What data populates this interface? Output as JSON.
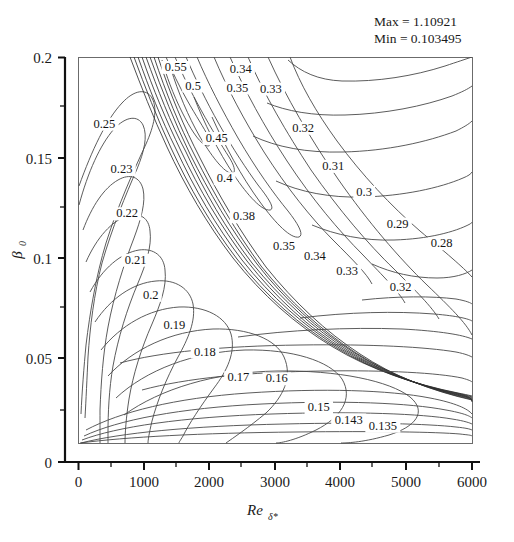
{
  "figure": {
    "kind": "contour-plot",
    "background": "#ffffff",
    "line_color": "#4a4a4a",
    "text_color": "#1a1a1a"
  },
  "annotations": {
    "max_line": "Max = 1.10921",
    "min_line": "Min = 0.103495"
  },
  "axes": {
    "x_title_main": "Re",
    "x_title_sub": "δ*",
    "y_title_main": "β",
    "y_title_sub": "0",
    "x_ticks": [
      "0",
      "1000",
      "2000",
      "3000",
      "4000",
      "5000",
      "6000"
    ],
    "y_ticks": [
      "0",
      "0.05",
      "0.1",
      "0.15",
      "0.2"
    ]
  },
  "chart_data": {
    "type": "contour",
    "title": "",
    "xlabel": "Re_delta*",
    "ylabel": "beta_0",
    "xlim": [
      0,
      6000
    ],
    "ylim": [
      0,
      0.2
    ],
    "plot_box": {
      "x0": 0,
      "x1": 6000,
      "y0": 0.0128,
      "y1": 0.2
    },
    "grid": false,
    "legend": null,
    "max_value": 1.10921,
    "min_value": 0.103495,
    "levels": [
      0.135,
      0.143,
      0.15,
      0.16,
      0.17,
      0.18,
      0.19,
      0.2,
      0.21,
      0.22,
      0.23,
      0.25,
      0.28,
      0.29,
      0.3,
      0.31,
      0.32,
      0.33,
      0.34,
      0.35,
      0.38,
      0.4,
      0.45,
      0.5,
      0.55
    ],
    "labels": [
      {
        "text": "0.55",
        "x": 1480,
        "y": 0.1935
      },
      {
        "text": "0.5",
        "x": 1745,
        "y": 0.1845
      },
      {
        "text": "0.34",
        "x": 2470,
        "y": 0.1925
      },
      {
        "text": "0.35",
        "x": 2420,
        "y": 0.1835
      },
      {
        "text": "0.33",
        "x": 2930,
        "y": 0.183
      },
      {
        "text": "0.25",
        "x": 395,
        "y": 0.166
      },
      {
        "text": "0.45",
        "x": 2105,
        "y": 0.159
      },
      {
        "text": "0.32",
        "x": 3420,
        "y": 0.164
      },
      {
        "text": "0.31",
        "x": 3880,
        "y": 0.1455
      },
      {
        "text": "0.23",
        "x": 655,
        "y": 0.144
      },
      {
        "text": "0.4",
        "x": 2225,
        "y": 0.1395
      },
      {
        "text": "0.3",
        "x": 4350,
        "y": 0.133
      },
      {
        "text": "0.38",
        "x": 2520,
        "y": 0.121
      },
      {
        "text": "0.22",
        "x": 740,
        "y": 0.1225
      },
      {
        "text": "0.29",
        "x": 4860,
        "y": 0.1175
      },
      {
        "text": "0.28",
        "x": 5530,
        "y": 0.108
      },
      {
        "text": "0.35",
        "x": 3130,
        "y": 0.1065
      },
      {
        "text": "0.34",
        "x": 3600,
        "y": 0.102
      },
      {
        "text": "0.21",
        "x": 870,
        "y": 0.1
      },
      {
        "text": "0.33",
        "x": 4090,
        "y": 0.0945
      },
      {
        "text": "0.32",
        "x": 4905,
        "y": 0.087
      },
      {
        "text": "0.2",
        "x": 1100,
        "y": 0.083
      },
      {
        "text": "0.19",
        "x": 1460,
        "y": 0.0685
      },
      {
        "text": "0.18",
        "x": 1925,
        "y": 0.0555
      },
      {
        "text": "0.17",
        "x": 2435,
        "y": 0.043
      },
      {
        "text": "0.16",
        "x": 3020,
        "y": 0.0425
      },
      {
        "text": "0.15",
        "x": 3660,
        "y": 0.0285
      },
      {
        "text": "0.143",
        "x": 4115,
        "y": 0.0225
      },
      {
        "text": "0.135",
        "x": 4635,
        "y": 0.0195
      }
    ]
  }
}
